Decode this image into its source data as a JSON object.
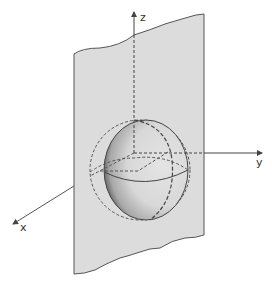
{
  "diagram": {
    "type": "3d-geometry",
    "axes": {
      "x": {
        "label": "x"
      },
      "y": {
        "label": "y"
      },
      "z": {
        "label": "z"
      }
    },
    "elements": [
      "plane",
      "hemisphere",
      "dashed-sphere-outline",
      "equator",
      "meridian"
    ]
  },
  "colors": {
    "plane_fill": "#dcdcdc",
    "line": "#4a4a4a",
    "background": "#ffffff"
  }
}
